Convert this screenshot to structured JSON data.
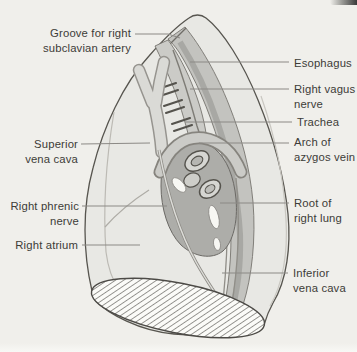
{
  "illustration": {
    "name": "right-lung-medial-surface-diagram"
  },
  "colors": {
    "page_bg": "#f0efeb",
    "lung_fill": "#e8e8e4",
    "lung_outline": "#57554f",
    "band_fill": "#c3c3bf",
    "band_shade": "#a5a5a1",
    "trachea_fill": "#cbcbc7",
    "svc_fill": "#dadad6",
    "svc_edge": "#96948f",
    "arch_fill": "#cbcbc7",
    "arch_edge": "#86847e",
    "hilum_fill": "#adada9",
    "vessel_ring_fill": "#d6d6d2",
    "highlight_fill": "#f7f7f3",
    "detail_stroke": "#55534d",
    "leader": "#8c8a86",
    "text": "#3d3c38",
    "diaphragm_fill": "#fbfbf8",
    "hatch_stroke": "#504e4a",
    "corner_artifact": "#3a3a3a"
  },
  "labels": {
    "groove_subclavian": {
      "line1": "Groove for right",
      "line2": "subclavian artery"
    },
    "esophagus": {
      "line1": "Esophagus"
    },
    "right_vagus": {
      "line1": "Right vagus",
      "line2": "nerve"
    },
    "trachea": {
      "line1": "Trachea"
    },
    "azygos_arch": {
      "line1": "Arch of",
      "line2": "azygos vein"
    },
    "superior_vena_cava": {
      "line1": "Superior",
      "line2": "vena cava"
    },
    "right_phrenic": {
      "line1": "Right phrenic",
      "line2": "nerve"
    },
    "right_atrium": {
      "line1": "Right atrium"
    },
    "root_right_lung": {
      "line1": "Root of",
      "line2": "right lung"
    },
    "inferior_vena_cava": {
      "line1": "Inferior",
      "line2": "vena cava"
    }
  }
}
